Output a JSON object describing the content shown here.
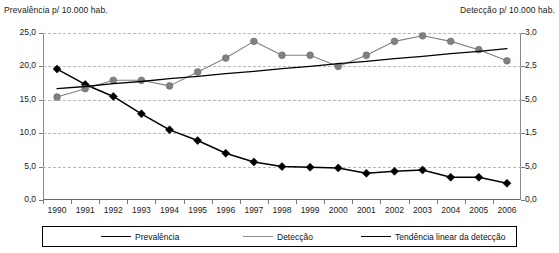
{
  "axis_titles": {
    "left": "Prevalência p/ 10.000 hab.",
    "right": "Detecção p/ 10.000 hab."
  },
  "legend": {
    "items": [
      {
        "label": "Prevalência",
        "marker": "diamond-black-icon",
        "color": "#000000"
      },
      {
        "label": "Detecção",
        "marker": "circle-gray-icon",
        "color": "#808080"
      },
      {
        "label": "Tendência linear da detecção",
        "marker": "line-icon",
        "color": "#000000"
      }
    ]
  },
  "chart_data": {
    "type": "line",
    "title": "",
    "xlabel": "",
    "ylabel": "Prevalência p/ 10.000 hab.",
    "y2label": "Detecção p/ 10.000 hab.",
    "grid": true,
    "legend_position": "bottom",
    "categories": [
      "1990",
      "1991",
      "1992",
      "1993",
      "1994",
      "1995",
      "1996",
      "1997",
      "1998",
      "1999",
      "2000",
      "2001",
      "2002",
      "2003",
      "2004",
      "2005",
      "2006"
    ],
    "ylim": [
      0,
      25
    ],
    "yticks": [
      "0,0",
      "5,0",
      "10,0",
      "15,0",
      "20,0",
      "25,0"
    ],
    "y2lim": [
      0,
      3
    ],
    "y2ticks": [
      "0,0",
      "5,0",
      "1,5",
      "5,0",
      "2,5",
      "3,0"
    ],
    "series": [
      {
        "name": "Prevalência",
        "axis": "left",
        "color": "#000000",
        "marker": "diamond",
        "values": [
          19.6,
          17.3,
          15.5,
          12.9,
          10.5,
          8.9,
          7.0,
          5.7,
          5.0,
          4.9,
          4.8,
          4.0,
          4.3,
          4.5,
          3.4,
          3.4,
          2.5
        ]
      },
      {
        "name": "Detecção",
        "axis": "right",
        "color": "#808080",
        "marker": "circle",
        "values": [
          1.85,
          2.0,
          2.15,
          2.15,
          2.05,
          2.3,
          2.55,
          2.85,
          2.6,
          2.6,
          2.4,
          2.6,
          2.85,
          2.95,
          2.85,
          2.7,
          2.5
        ]
      },
      {
        "name": "Tendência linear da detecção",
        "axis": "right",
        "color": "#000000",
        "marker": "none",
        "type": "trend",
        "values": [
          2.0,
          2.04,
          2.09,
          2.13,
          2.18,
          2.22,
          2.27,
          2.31,
          2.36,
          2.4,
          2.45,
          2.49,
          2.54,
          2.58,
          2.63,
          2.67,
          2.72
        ]
      }
    ]
  }
}
